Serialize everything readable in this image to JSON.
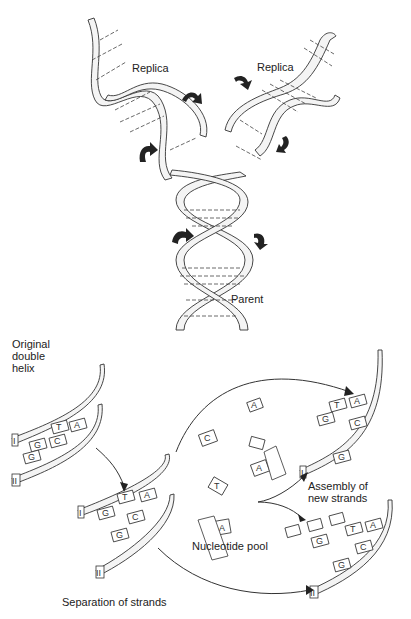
{
  "top_panel": {
    "title": "DNA replication (helix view)",
    "labels": {
      "replica_left": "Replica",
      "replica_right": "Replica",
      "parent": "Parent"
    }
  },
  "bottom_panel": {
    "title": "Strand separation and assembly",
    "labels": {
      "original": "Original\ndouble\nhelix",
      "separation": "Separation of strands",
      "pool": "Nucleotide pool",
      "assembly": "Assembly of\nnew strands"
    },
    "strand_markers": [
      "I",
      "II"
    ],
    "bases": [
      "A",
      "T",
      "G",
      "C"
    ]
  }
}
